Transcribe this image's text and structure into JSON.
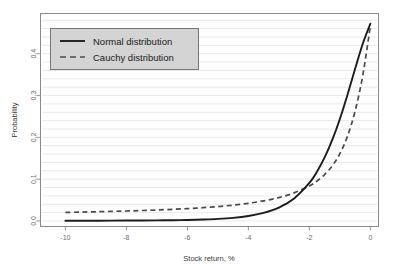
{
  "chart_data": {
    "type": "line",
    "title": "",
    "xlabel": "Stock return, %",
    "ylabel": "Probability",
    "xlim": [
      -10.8,
      0.25
    ],
    "ylim": [
      -0.012,
      0.495
    ],
    "grid": true,
    "grid_orientation": "horizontal",
    "grid_step": 0.02,
    "legend_position": "top-left",
    "xticks": [
      -10,
      -8,
      -6,
      -4,
      -2,
      0
    ],
    "xtick_labels": [
      "-10",
      "-8",
      "-6",
      "-4",
      "-2",
      "0"
    ],
    "yticks": [
      0.0,
      0.1,
      0.2,
      0.3,
      0.4
    ],
    "ytick_labels": [
      "0.0",
      "0.1",
      "0.2",
      "0.3",
      "0.4"
    ],
    "x": [
      -10.0,
      -9.5,
      -9.0,
      -8.5,
      -8.0,
      -7.5,
      -7.0,
      -6.5,
      -6.0,
      -5.5,
      -5.0,
      -4.5,
      -4.0,
      -3.5,
      -3.0,
      -2.5,
      -2.0,
      -1.75,
      -1.5,
      -1.25,
      -1.0,
      -0.75,
      -0.5,
      -0.25,
      0.0
    ],
    "series": [
      {
        "name": "Normal distribution",
        "style": "solid",
        "color": "#1c1c1c",
        "values": [
          0.0005,
          0.0006,
          0.0007,
          0.0008,
          0.001,
          0.0012,
          0.0015,
          0.0019,
          0.0025,
          0.0035,
          0.005,
          0.0075,
          0.012,
          0.0195,
          0.032,
          0.054,
          0.091,
          0.118,
          0.152,
          0.194,
          0.244,
          0.302,
          0.364,
          0.424,
          0.472
        ]
      },
      {
        "name": "Cauchy distribution",
        "style": "dashed",
        "color": "#4a4a4a",
        "values": [
          0.0205,
          0.0212,
          0.022,
          0.0229,
          0.0239,
          0.025,
          0.0263,
          0.0278,
          0.0296,
          0.0318,
          0.0345,
          0.0379,
          0.0423,
          0.0481,
          0.056,
          0.0672,
          0.0838,
          0.0955,
          0.111,
          0.132,
          0.161,
          0.203,
          0.263,
          0.348,
          0.466
        ]
      }
    ],
    "legend_entries": [
      {
        "label": "Normal distribution",
        "style": "solid"
      },
      {
        "label": "Cauchy distribution",
        "style": "dashed"
      }
    ],
    "colors": {
      "normal": "#1c1c1c",
      "cauchy": "#4a4a4a",
      "grid": "#e3e3e6",
      "frame": "#8a8a8a",
      "legend_fill": "#d4d4d4",
      "background": "#ffffff"
    }
  }
}
